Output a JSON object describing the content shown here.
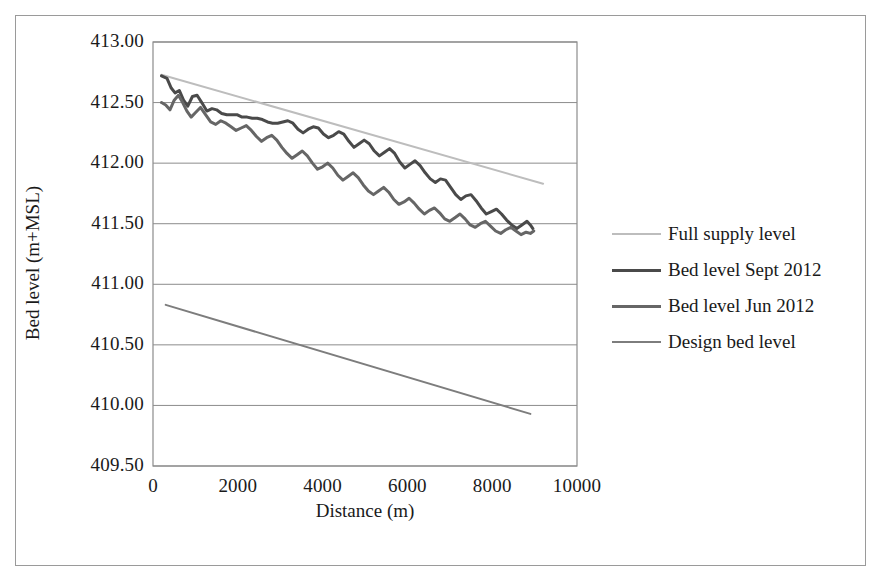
{
  "chart_data": {
    "type": "line",
    "title": "",
    "xlabel": "Distance (m)",
    "ylabel": "Bed level (m+MSL)",
    "xlim": [
      0,
      10000
    ],
    "ylim": [
      409.5,
      413.0
    ],
    "xticks": [
      "0",
      "2000",
      "4000",
      "6000",
      "8000",
      "10000"
    ],
    "yticks": [
      "409.50",
      "410.00",
      "410.50",
      "411.00",
      "411.50",
      "412.00",
      "412.50",
      "413.00"
    ],
    "grid": "horizontal",
    "legend_position": "right",
    "series": [
      {
        "name": "Full supply level",
        "color": "#bdbdbd",
        "width": 2,
        "x": [
          200,
          9200
        ],
        "values": [
          412.73,
          411.83
        ]
      },
      {
        "name": "Bed level Sept 2012",
        "color": "#4a4a4a",
        "width": 3,
        "x": [
          200,
          330,
          430,
          520,
          620,
          720,
          820,
          930,
          1040,
          1150,
          1270,
          1390,
          1500,
          1620,
          1740,
          1860,
          1980,
          2100,
          2220,
          2340,
          2460,
          2580,
          2700,
          2820,
          2940,
          3060,
          3180,
          3300,
          3420,
          3540,
          3660,
          3780,
          3900,
          4020,
          4140,
          4260,
          4380,
          4500,
          4620,
          4740,
          4860,
          4980,
          5100,
          5220,
          5340,
          5460,
          5580,
          5700,
          5820,
          5940,
          6060,
          6180,
          6300,
          6420,
          6540,
          6660,
          6780,
          6900,
          7020,
          7140,
          7260,
          7380,
          7500,
          7620,
          7740,
          7860,
          7980,
          8100,
          8220,
          8340,
          8460,
          8580,
          8700,
          8820,
          8900,
          8960
        ],
        "values": [
          412.72,
          412.7,
          412.62,
          412.58,
          412.6,
          412.52,
          412.47,
          412.55,
          412.56,
          412.5,
          412.43,
          412.45,
          412.44,
          412.41,
          412.4,
          412.4,
          412.4,
          412.38,
          412.38,
          412.37,
          412.37,
          412.36,
          412.34,
          412.33,
          412.33,
          412.34,
          412.35,
          412.33,
          412.28,
          412.25,
          412.28,
          412.3,
          412.29,
          412.24,
          412.21,
          412.23,
          412.26,
          412.24,
          412.18,
          412.13,
          412.16,
          412.19,
          412.16,
          412.1,
          412.06,
          412.09,
          412.12,
          412.08,
          412.01,
          411.96,
          411.99,
          412.02,
          411.98,
          411.92,
          411.87,
          411.84,
          411.87,
          411.86,
          411.8,
          411.74,
          411.7,
          411.73,
          411.74,
          411.69,
          411.63,
          411.58,
          411.6,
          411.62,
          411.58,
          411.53,
          411.49,
          411.46,
          411.49,
          411.52,
          411.49,
          411.46
        ]
      },
      {
        "name": "Bed level Jun 2012",
        "color": "#666666",
        "width": 3,
        "x": [
          200,
          300,
          400,
          500,
          600,
          700,
          800,
          900,
          1010,
          1120,
          1240,
          1360,
          1480,
          1600,
          1720,
          1840,
          1960,
          2080,
          2200,
          2320,
          2440,
          2560,
          2680,
          2800,
          2920,
          3040,
          3160,
          3280,
          3400,
          3520,
          3640,
          3760,
          3880,
          4000,
          4120,
          4240,
          4360,
          4480,
          4600,
          4720,
          4840,
          4960,
          5080,
          5200,
          5320,
          5440,
          5560,
          5680,
          5800,
          5920,
          6040,
          6160,
          6280,
          6400,
          6520,
          6640,
          6760,
          6880,
          7000,
          7120,
          7240,
          7360,
          7480,
          7600,
          7720,
          7840,
          7960,
          8080,
          8200,
          8320,
          8440,
          8560,
          8680,
          8800,
          8900,
          8980
        ],
        "values": [
          412.5,
          412.48,
          412.44,
          412.52,
          412.56,
          412.5,
          412.43,
          412.38,
          412.42,
          412.46,
          412.4,
          412.34,
          412.32,
          412.35,
          412.33,
          412.3,
          412.27,
          412.29,
          412.31,
          412.27,
          412.22,
          412.18,
          412.21,
          412.23,
          412.19,
          412.13,
          412.08,
          412.04,
          412.07,
          412.1,
          412.06,
          412.0,
          411.95,
          411.97,
          412.0,
          411.96,
          411.9,
          411.86,
          411.89,
          411.92,
          411.88,
          411.82,
          411.77,
          411.74,
          411.77,
          411.8,
          411.76,
          411.7,
          411.66,
          411.68,
          411.71,
          411.67,
          411.62,
          411.58,
          411.61,
          411.63,
          411.59,
          411.54,
          411.52,
          411.55,
          411.58,
          411.54,
          411.49,
          411.47,
          411.5,
          411.52,
          411.48,
          411.44,
          411.42,
          411.45,
          411.47,
          411.44,
          411.41,
          411.43,
          411.42,
          411.44
        ]
      },
      {
        "name": "Design bed level",
        "color": "#7d7d7d",
        "width": 2,
        "x": [
          300,
          8900
        ],
        "values": [
          410.83,
          409.93
        ]
      }
    ]
  },
  "legend": {
    "items": [
      {
        "label": "Full supply level"
      },
      {
        "label": "Bed level Sept 2012"
      },
      {
        "label": "Bed level Jun 2012"
      },
      {
        "label": "Design bed level"
      }
    ]
  }
}
